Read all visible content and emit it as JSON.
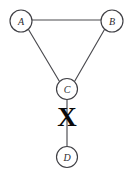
{
  "figure": {
    "width": 129,
    "height": 176,
    "background_color": "#ffffff",
    "stroke_color": "#4a4a4f",
    "node_stroke_color": "#3f3f44",
    "label_color": "#2b2b30",
    "marker_color": "#0a0a0a"
  },
  "graph": {
    "nodes": [
      {
        "id": "A",
        "label": "A",
        "cx": 21,
        "cy": 21,
        "r": 11
      },
      {
        "id": "B",
        "label": "B",
        "cx": 112,
        "cy": 21,
        "r": 11
      },
      {
        "id": "C",
        "label": "C",
        "cx": 67,
        "cy": 89,
        "r": 10.5
      },
      {
        "id": "D",
        "label": "D",
        "cx": 67,
        "cy": 157,
        "r": 10.5
      }
    ],
    "edges": [
      {
        "id": "edge-a-b",
        "from": "A",
        "to": "B",
        "x1": 32,
        "y1": 20,
        "x2": 101,
        "y2": 20,
        "blocked": false
      },
      {
        "id": "edge-a-c",
        "from": "A",
        "to": "C",
        "x1": 28.5,
        "y1": 29.5,
        "x2": 59.5,
        "y2": 81.5,
        "blocked": false
      },
      {
        "id": "edge-b-c",
        "from": "B",
        "to": "C",
        "x1": 104.5,
        "y1": 29.5,
        "x2": 74.5,
        "y2": 81.5,
        "blocked": false
      },
      {
        "id": "edge-c-d",
        "from": "C",
        "to": "D",
        "x1": 67,
        "y1": 99.5,
        "x2": 67,
        "y2": 146.5,
        "blocked": true
      }
    ],
    "markers": [
      {
        "id": "blocked-edge-marker",
        "glyph": "X",
        "on_edge": "edge-c-d",
        "x": 67,
        "y": 117
      }
    ]
  }
}
